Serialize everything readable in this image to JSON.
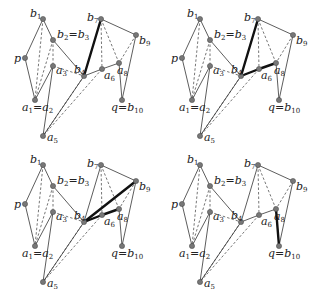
{
  "figure": {
    "colors": {
      "line": "#333333",
      "dash": "#666666",
      "thick": "#111111",
      "node": "#777777",
      "background": "#ffffff"
    },
    "points": {
      "b1": {
        "x": 43,
        "y": 19,
        "label": "b",
        "sub": "1"
      },
      "b23": {
        "x": 53,
        "y": 40,
        "label": "b",
        "sub": "2",
        "eq": "=b",
        "sub2": "3"
      },
      "p": {
        "x": 25,
        "y": 58,
        "label": "p"
      },
      "a3": {
        "x": 53,
        "y": 66,
        "label": "a",
        "sub": "3"
      },
      "a12": {
        "x": 35,
        "y": 100,
        "label": "a",
        "sub": "1",
        "eq": "=a",
        "sub2": "2"
      },
      "a5": {
        "x": 43,
        "y": 136,
        "label": "a",
        "sub": "5"
      },
      "b4": {
        "x": 84,
        "y": 76,
        "label": "b",
        "sub": "4"
      },
      "a6": {
        "x": 102,
        "y": 69,
        "label": "a",
        "sub": "6"
      },
      "b7": {
        "x": 101,
        "y": 19,
        "label": "b",
        "sub": "7"
      },
      "b9": {
        "x": 136,
        "y": 35,
        "label": "b",
        "sub": "9"
      },
      "a8": {
        "x": 119,
        "y": 63,
        "label": "a",
        "sub": "8"
      },
      "q": {
        "x": 122,
        "y": 100,
        "label": "q",
        "eq": "=b",
        "sub2": "10"
      }
    },
    "solid_edges": [
      [
        "p",
        "b1"
      ],
      [
        "b1",
        "b23"
      ],
      [
        "b23",
        "b4"
      ],
      [
        "p",
        "a12"
      ],
      [
        "a12",
        "a3"
      ],
      [
        "a3",
        "a5"
      ],
      [
        "a5",
        "b4"
      ],
      [
        "b4",
        "b7"
      ],
      [
        "b7",
        "b9"
      ],
      [
        "b9",
        "q"
      ],
      [
        "q",
        "a8"
      ],
      [
        "a8",
        "a6"
      ],
      [
        "a6",
        "b4"
      ]
    ],
    "dashed_edges": [
      [
        "b1",
        "a12"
      ],
      [
        "b23",
        "a12"
      ],
      [
        "b23",
        "a3"
      ],
      [
        "a3",
        "b4"
      ],
      [
        "b4",
        "a5"
      ],
      [
        "a6",
        "a5"
      ],
      [
        "b7",
        "a6"
      ],
      [
        "b7",
        "a8"
      ],
      [
        "b9",
        "a8"
      ]
    ],
    "panels": [
      {
        "id": "top-left",
        "dx": 0,
        "dy": 0,
        "thick_edges": [
          [
            "b4",
            "b7"
          ]
        ]
      },
      {
        "id": "top-right",
        "dx": 157,
        "dy": 0,
        "thick_edges": [
          [
            "b4",
            "b7"
          ],
          [
            "b4",
            "a6"
          ],
          [
            "a6",
            "a8"
          ]
        ]
      },
      {
        "id": "bottom-left",
        "dx": 0,
        "dy": 146,
        "thick_edges": [
          [
            "b4",
            "b9"
          ],
          [
            "b4",
            "a6"
          ],
          [
            "a6",
            "a8"
          ]
        ]
      },
      {
        "id": "bottom-right",
        "dx": 157,
        "dy": 146,
        "thick_edges": [
          [
            "a8",
            "q"
          ]
        ]
      }
    ]
  }
}
